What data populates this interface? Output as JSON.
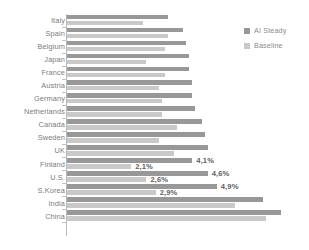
{
  "chart_data": {
    "type": "bar",
    "orientation": "horizontal",
    "title": "",
    "subtitle": "",
    "xlabel": "",
    "ylabel": "",
    "grid": false,
    "xlim": [
      0,
      7.4
    ],
    "legend_position": "top-right",
    "categories": [
      "Italy",
      "Spain",
      "Belgium",
      "Japan",
      "France",
      "Austria",
      "Germany",
      "Netherlands",
      "Canada",
      "Sweden",
      "UK",
      "Finland",
      "U.S.",
      "S.Korea",
      "India",
      "China"
    ],
    "series": [
      {
        "name": "AI Steady",
        "color": "#989898",
        "values": [
          3.3,
          3.8,
          3.9,
          4.0,
          4.0,
          4.1,
          4.1,
          4.2,
          4.4,
          4.5,
          4.6,
          4.1,
          4.6,
          4.9,
          6.4,
          7.0
        ]
      },
      {
        "name": "Baseline",
        "color": "#c9c9c9",
        "values": [
          2.5,
          3.3,
          3.2,
          2.6,
          3.2,
          3.0,
          3.1,
          3.1,
          3.6,
          3.0,
          3.5,
          2.1,
          2.6,
          2.9,
          5.5,
          6.5
        ]
      }
    ],
    "data_labels": [
      {
        "category": "Finland",
        "series": "AI Steady",
        "text": "4,1%"
      },
      {
        "category": "Finland",
        "series": "Baseline",
        "text": "2,1%"
      },
      {
        "category": "U.S.",
        "series": "AI Steady",
        "text": "4,6%"
      },
      {
        "category": "U.S.",
        "series": "Baseline",
        "text": "2,6%"
      },
      {
        "category": "S.Korea",
        "series": "AI Steady",
        "text": "4,9%"
      },
      {
        "category": "S.Korea",
        "series": "Baseline",
        "text": "2,9%"
      }
    ]
  },
  "legend": {
    "items": [
      {
        "label": "AI Steady",
        "color": "#989898",
        "swatch": "square-swatch"
      },
      {
        "label": "Baseline",
        "color": "#c9c9c9",
        "swatch": "square-swatch"
      }
    ]
  },
  "style": {
    "background": "#ffffff",
    "axis_color": "#b9b9b9",
    "label_color": "#7d7d7d",
    "value_color": "#5f5f5f"
  }
}
